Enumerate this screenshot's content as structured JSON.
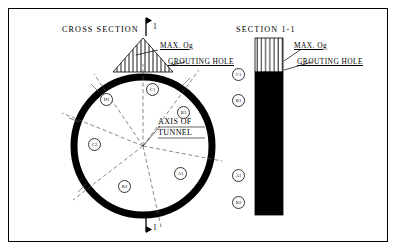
{
  "diagram": {
    "titles": {
      "cross_section": "CROSS  SECTION",
      "section_1_1": "SECTION  1-1"
    },
    "section_marks": {
      "top": "1",
      "bottom": "1"
    },
    "annotations": {
      "max_og_left": "MAX. Og",
      "grouting_hole_left": "GROUTING  HOLE",
      "max_og_right": "MAX. Og",
      "grouting_hole_right": "GROUTING  HOLE",
      "axis_line1": "AXIS OF",
      "axis_line2": "TUNNEL"
    },
    "cross_section_zones": [
      {
        "id": "zone-c1",
        "label": "C1",
        "x": 146,
        "y": 83
      },
      {
        "id": "zone-d1",
        "label": "D1",
        "x": 100,
        "y": 93
      },
      {
        "id": "zone-b1",
        "label": "B1",
        "x": 177,
        "y": 106
      },
      {
        "id": "zone-c2",
        "label": "C2",
        "x": 88,
        "y": 138
      },
      {
        "id": "zone-b2",
        "label": "B2",
        "x": 118,
        "y": 180
      },
      {
        "id": "zone-a1",
        "label": "A1",
        "x": 174,
        "y": 167
      }
    ],
    "section_column_zones": [
      {
        "id": "col-c1",
        "label": "C1",
        "y": 68
      },
      {
        "id": "col-b1",
        "label": "B1",
        "y": 94
      },
      {
        "id": "col-a1",
        "label": "A1",
        "y": 169
      },
      {
        "id": "col-b2",
        "label": "B2",
        "y": 196
      }
    ],
    "colors": {
      "ink": "#000000",
      "paper": "#ffffff",
      "dash": "#555555",
      "frame": "#000000"
    }
  }
}
